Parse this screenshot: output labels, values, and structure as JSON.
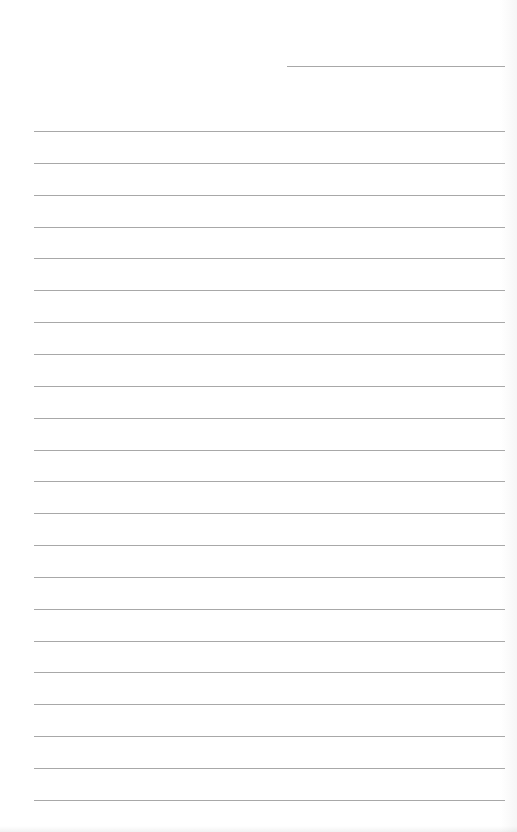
{
  "page": {
    "type": "blank lined writing sheet",
    "rule_color": "#a8a8a8",
    "header_rule": {
      "x": 287,
      "y": 66,
      "width": 218
    },
    "body_rules": {
      "x": 34,
      "width": 471,
      "first_y": 131,
      "spacing": 31.85,
      "count": 22
    }
  }
}
